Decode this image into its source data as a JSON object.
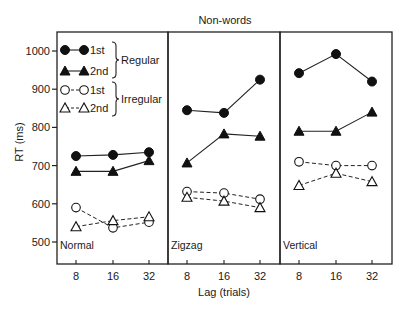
{
  "chart_data": {
    "type": "line",
    "title": "Non-words",
    "xlabel": "Lag (trials)",
    "ylabel": "RT (ms)",
    "ylim": [
      450,
      1050
    ],
    "yticks": [
      500,
      600,
      700,
      800,
      900,
      1000
    ],
    "x": [
      8,
      16,
      32
    ],
    "xtick_labels": [
      "8",
      "16",
      "32"
    ],
    "grid": false,
    "legend_position": "upper-left inside first panel",
    "legend": [
      {
        "marker": "filled-circle",
        "line": "solid",
        "label": "1st",
        "group": "Regular"
      },
      {
        "marker": "filled-triangle",
        "line": "solid",
        "label": "2nd",
        "group": "Regular"
      },
      {
        "marker": "open-circle",
        "line": "dashed",
        "label": "1st",
        "group": "Irregular"
      },
      {
        "marker": "open-triangle",
        "line": "dashed",
        "label": "2nd",
        "group": "Irregular"
      }
    ],
    "legend_groups": [
      "Regular",
      "Irregular"
    ],
    "panels": [
      {
        "label": "Normal",
        "series": [
          {
            "name": "Regular 1st",
            "marker": "filled-circle",
            "line": "solid",
            "values": [
              725,
              728,
              735
            ]
          },
          {
            "name": "Regular 2nd",
            "marker": "filled-triangle",
            "line": "solid",
            "values": [
              685,
              685,
              713
            ]
          },
          {
            "name": "Irregular 1st",
            "marker": "open-circle",
            "line": "dashed",
            "values": [
              590,
              537,
              552
            ]
          },
          {
            "name": "Irregular 2nd",
            "marker": "open-triangle",
            "line": "dashed",
            "values": [
              540,
              556,
              566
            ]
          }
        ]
      },
      {
        "label": "Zigzag",
        "series": [
          {
            "name": "Regular 1st",
            "marker": "filled-circle",
            "line": "solid",
            "values": [
              845,
              838,
              925
            ]
          },
          {
            "name": "Regular 2nd",
            "marker": "filled-triangle",
            "line": "solid",
            "values": [
              707,
              783,
              777
            ]
          },
          {
            "name": "Irregular 1st",
            "marker": "open-circle",
            "line": "dashed",
            "values": [
              632,
              628,
              612
            ]
          },
          {
            "name": "Irregular 2nd",
            "marker": "open-triangle",
            "line": "dashed",
            "values": [
              617,
              607,
              590
            ]
          }
        ]
      },
      {
        "label": "Vertical",
        "series": [
          {
            "name": "Regular 1st",
            "marker": "filled-circle",
            "line": "solid",
            "values": [
              942,
              992,
              920
            ]
          },
          {
            "name": "Regular 2nd",
            "marker": "filled-triangle",
            "line": "solid",
            "values": [
              790,
              790,
              840
            ]
          },
          {
            "name": "Irregular 1st",
            "marker": "open-circle",
            "line": "dashed",
            "values": [
              710,
              700,
              700
            ]
          },
          {
            "name": "Irregular 2nd",
            "marker": "open-triangle",
            "line": "dashed",
            "values": [
              648,
              680,
              658
            ]
          }
        ]
      }
    ]
  }
}
